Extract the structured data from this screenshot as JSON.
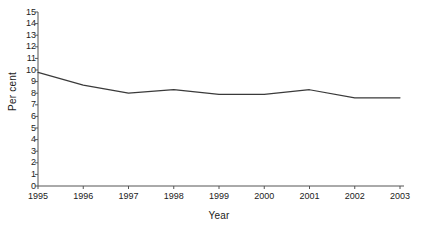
{
  "chart_data": {
    "type": "line",
    "title": "",
    "xlabel": "Year",
    "ylabel": "Per cent",
    "categories": [
      "1995",
      "1996",
      "1997",
      "1998",
      "1999",
      "2000",
      "2001",
      "2002",
      "2003"
    ],
    "x": [
      1995,
      1996,
      1997,
      1998,
      1999,
      2000,
      2001,
      2002,
      2003
    ],
    "values": [
      9.8,
      8.7,
      8.0,
      8.3,
      7.9,
      7.9,
      8.3,
      7.6,
      7.6
    ],
    "series": [
      {
        "name": "Per cent",
        "values": [
          9.8,
          8.7,
          8.0,
          8.3,
          7.9,
          7.9,
          8.3,
          7.6,
          7.6
        ],
        "color": "#3a3a3a"
      }
    ],
    "ylim": [
      0,
      15
    ],
    "yticks": [
      0,
      1,
      2,
      3,
      4,
      5,
      6,
      7,
      8,
      9,
      10,
      11,
      12,
      13,
      14,
      15
    ],
    "ytick_labels": [
      "0",
      "1",
      "2",
      "3",
      "4",
      "5",
      "6",
      "7",
      "8",
      "9",
      "10",
      "11",
      "12",
      "13",
      "14",
      "15"
    ],
    "xtick_labels": [
      "1995",
      "1996",
      "1997",
      "1998",
      "1999",
      "2000",
      "2001",
      "2002",
      "2003"
    ],
    "grid": false,
    "legend": "none",
    "axis_color": "#555555",
    "line_color": "#3a3a3a",
    "background": "#ffffff"
  }
}
